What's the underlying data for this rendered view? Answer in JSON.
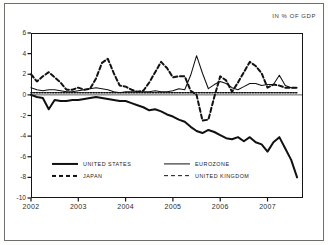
{
  "units_caption": "IN % OF GDP",
  "chart_data": {
    "type": "line",
    "title": "",
    "subtitle": "",
    "xlabel": "",
    "ylabel": "IN % OF GDP",
    "xlim": [
      2002.0,
      2007.75
    ],
    "ylim": [
      -10,
      6
    ],
    "yticks": [
      6,
      4,
      2,
      0,
      -2,
      -4,
      -6,
      -8,
      -10
    ],
    "ytick_labels": [
      "6",
      "4",
      "2",
      "0",
      "-2",
      "-4",
      "-6",
      "-8",
      "-10"
    ],
    "xticks": [
      2002,
      2003,
      2004,
      2005,
      2006,
      2007
    ],
    "xtick_labels": [
      "2002",
      "2003",
      "2004",
      "2005",
      "2006",
      "2007"
    ],
    "grid": false,
    "legend_position": "inside-lower-left",
    "zero_line": true,
    "x": [
      2002.0,
      2002.125,
      2002.25,
      2002.375,
      2002.5,
      2002.625,
      2002.75,
      2002.875,
      2003.0,
      2003.125,
      2003.25,
      2003.375,
      2003.5,
      2003.625,
      2003.75,
      2003.875,
      2004.0,
      2004.125,
      2004.25,
      2004.375,
      2004.5,
      2004.625,
      2004.75,
      2004.875,
      2005.0,
      2005.125,
      2005.25,
      2005.375,
      2005.5,
      2005.625,
      2005.75,
      2005.875,
      2006.0,
      2006.125,
      2006.25,
      2006.375,
      2006.5,
      2006.625,
      2006.75,
      2006.875,
      2007.0,
      2007.125,
      2007.25,
      2007.375,
      2007.5,
      2007.625
    ],
    "series": [
      {
        "name": "UNITED STATES",
        "style": "solid",
        "width": "thick",
        "color": "#111111",
        "values": [
          0.0,
          -0.2,
          -0.3,
          -1.4,
          -0.5,
          -0.6,
          -0.6,
          -0.5,
          -0.5,
          -0.4,
          -0.3,
          -0.2,
          -0.3,
          -0.4,
          -0.5,
          -0.6,
          -0.6,
          -0.8,
          -1.0,
          -1.2,
          -1.5,
          -1.4,
          -1.6,
          -1.9,
          -2.1,
          -2.4,
          -2.6,
          -3.1,
          -3.5,
          -3.7,
          -3.4,
          -3.6,
          -3.9,
          -4.2,
          -4.3,
          -4.1,
          -4.5,
          -4.1,
          -4.6,
          -4.8,
          -5.5,
          -4.6,
          -4.1,
          -5.2,
          -6.3,
          -8.0
        ]
      },
      {
        "name": "EUROZONE",
        "style": "solid",
        "width": "thin",
        "color": "#111111",
        "values": [
          0.7,
          0.5,
          0.4,
          0.5,
          0.5,
          0.4,
          0.3,
          0.3,
          0.4,
          0.5,
          0.6,
          0.7,
          0.6,
          0.5,
          0.3,
          0.2,
          0.3,
          0.3,
          0.3,
          0.3,
          0.3,
          0.4,
          0.3,
          0.3,
          0.4,
          0.6,
          0.5,
          1.9,
          3.8,
          2.1,
          0.6,
          1.0,
          1.3,
          1.1,
          0.7,
          0.5,
          0.8,
          1.1,
          1.1,
          0.9,
          1.0,
          1.0,
          1.9,
          0.9,
          0.7,
          0.7
        ]
      },
      {
        "name": "JAPAN",
        "style": "dashed",
        "width": "thick",
        "color": "#111111",
        "values": [
          2.0,
          1.3,
          1.8,
          2.2,
          1.7,
          1.2,
          0.5,
          0.5,
          0.7,
          0.5,
          0.6,
          1.6,
          3.1,
          3.5,
          2.1,
          0.9,
          0.8,
          0.5,
          0.3,
          0.4,
          1.2,
          2.2,
          3.2,
          2.6,
          1.7,
          1.8,
          1.8,
          0.4,
          0.0,
          -2.5,
          -2.4,
          -0.2,
          1.8,
          1.4,
          0.3,
          1.2,
          2.2,
          3.2,
          2.8,
          2.1,
          0.7,
          1.0,
          0.9,
          0.7,
          0.7,
          0.7
        ]
      },
      {
        "name": "UNITED KINGDOM",
        "style": "dotted",
        "width": "thin",
        "color": "#111111",
        "values": [
          0.2,
          0.2,
          0.2,
          0.2,
          0.2,
          0.2,
          0.2,
          0.2,
          0.2,
          0.2,
          0.2,
          0.2,
          0.2,
          0.2,
          0.2,
          0.2,
          0.2,
          0.2,
          0.2,
          0.2,
          0.2,
          0.2,
          0.2,
          0.2,
          0.2,
          0.2,
          0.2,
          0.2,
          0.2,
          0.2,
          0.2,
          0.2,
          0.2,
          0.2,
          0.2,
          0.2,
          0.2,
          0.2,
          0.2,
          0.2,
          0.2,
          0.2,
          0.2,
          0.2,
          0.2,
          0.2
        ]
      }
    ]
  },
  "legend": {
    "items": [
      {
        "label": "UNITED STATES",
        "swatch": "solid-thick"
      },
      {
        "label": "EUROZONE",
        "swatch": "solid-thin"
      },
      {
        "label": "JAPAN",
        "swatch": "dashed-thick"
      },
      {
        "label": "UNITED KINGDOM",
        "swatch": "dashed-thin"
      }
    ]
  }
}
